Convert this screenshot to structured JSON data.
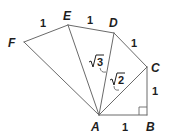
{
  "figure": {
    "vertices": {
      "A": {
        "label": "A",
        "x": 99,
        "y": 115
      },
      "B": {
        "label": "B",
        "x": 147,
        "y": 115
      },
      "C": {
        "label": "C",
        "x": 147,
        "y": 67
      },
      "D": {
        "label": "D",
        "x": 114,
        "y": 33
      },
      "E": {
        "label": "E",
        "x": 68,
        "y": 25
      },
      "F": {
        "label": "F",
        "x": 24,
        "y": 42
      }
    },
    "outer_edges": [
      {
        "from": "A",
        "to": "B",
        "length_label": "1"
      },
      {
        "from": "B",
        "to": "C",
        "length_label": "1"
      },
      {
        "from": "C",
        "to": "D",
        "length_label": "1"
      },
      {
        "from": "D",
        "to": "E",
        "length_label": "1"
      },
      {
        "from": "E",
        "to": "F",
        "length_label": "1"
      }
    ],
    "spokes": [
      {
        "from": "A",
        "to": "C",
        "length_label": "√2",
        "radicand": "2"
      },
      {
        "from": "A",
        "to": "D",
        "length_label": "√3",
        "radicand": "3"
      },
      {
        "from": "A",
        "to": "E"
      },
      {
        "from": "A",
        "to": "F"
      }
    ],
    "right_angle_at": "B",
    "labels": {
      "A": "A",
      "B": "B",
      "C": "C",
      "D": "D",
      "E": "E",
      "F": "F",
      "len_AB": "1",
      "len_BC": "1",
      "len_CD": "1",
      "len_DE": "1",
      "len_EF": "1",
      "rad_AC": "2",
      "rad_AD": "3"
    },
    "colors": {
      "line": "#6a6a6a",
      "text": "#1e1e1e",
      "background": "#ffffff"
    }
  }
}
